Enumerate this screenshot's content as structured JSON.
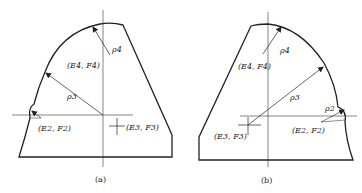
{
  "figure": {
    "panels": [
      {
        "id": "a",
        "caption": "(a)",
        "labels": {
          "rho4": "ρ4",
          "rho3": "ρ3",
          "E4F4": "(E4, F4)",
          "E2F2": "(E2, F2)",
          "E3F3": "(E3, F3)"
        }
      },
      {
        "id": "b",
        "caption": "(b)",
        "labels": {
          "rho4": "ρ4",
          "rho3": "ρ3",
          "rho2": "ρ2",
          "E4F4": "(E4, F4)",
          "E2F2": "(E2, F2)",
          "E3F3": "(E3, F3)"
        }
      }
    ],
    "colors": {
      "line": "#222222",
      "background": "#ffffff"
    }
  }
}
